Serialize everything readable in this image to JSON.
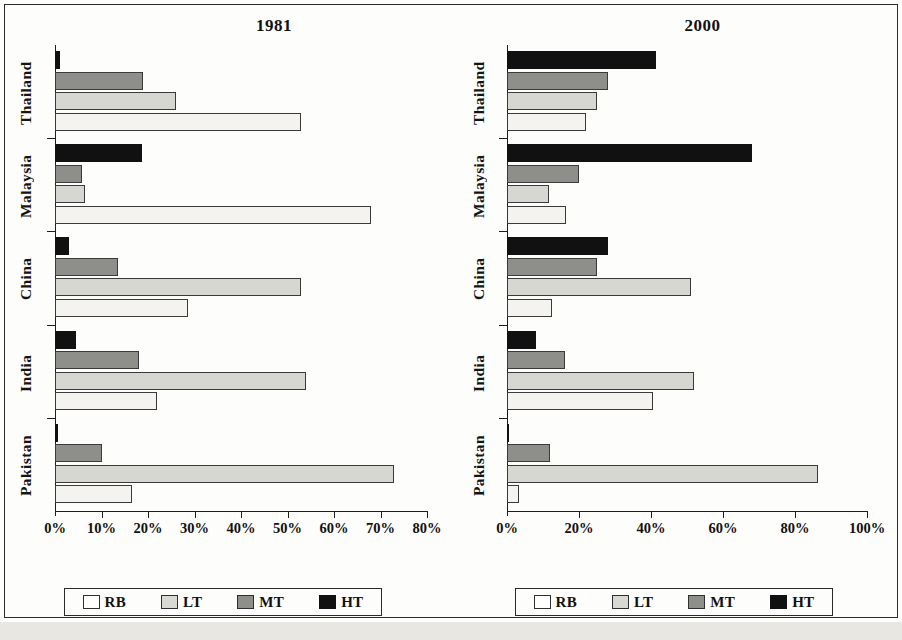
{
  "chart_data": [
    {
      "type": "bar",
      "title": "1981",
      "orientation": "horizontal",
      "grouped": true,
      "categories": [
        "Thailand",
        "Malaysia",
        "China",
        "India",
        "Pakistan"
      ],
      "series": [
        {
          "name": "RB",
          "color": "#f4f3ef",
          "values": [
            53.0,
            68.0,
            28.5,
            22.0,
            16.5
          ]
        },
        {
          "name": "LT",
          "color": "#d7d7d2",
          "values": [
            26.0,
            6.4,
            53.0,
            54.0,
            73.0
          ]
        },
        {
          "name": "MT",
          "color": "#8e8e8b",
          "values": [
            19.0,
            5.8,
            13.5,
            18.0,
            10.0
          ]
        },
        {
          "name": "HT",
          "color": "#111111",
          "values": [
            1.0,
            18.8,
            3.0,
            4.5,
            0.6
          ]
        }
      ],
      "xlabel": "",
      "ylabel": "",
      "xlim": [
        0,
        80
      ],
      "xticks": [
        0,
        10,
        20,
        30,
        40,
        50,
        60,
        70,
        80
      ],
      "xticklabels": [
        "0%",
        "10%",
        "20%",
        "30%",
        "40%",
        "50%",
        "60%",
        "70%",
        "80%"
      ],
      "grid": false,
      "legend_position": "bottom",
      "legend_entries": [
        "RB",
        "LT",
        "MT",
        "HT"
      ]
    },
    {
      "type": "bar",
      "title": "2000",
      "orientation": "horizontal",
      "grouped": true,
      "categories": [
        "Thailand",
        "Malaysia",
        "China",
        "India",
        "Pakistan"
      ],
      "series": [
        {
          "name": "RB",
          "color": "#f4f3ef",
          "values": [
            22.0,
            16.4,
            12.5,
            40.5,
            3.4
          ]
        },
        {
          "name": "LT",
          "color": "#d7d7d2",
          "values": [
            25.0,
            11.6,
            51.0,
            52.0,
            86.5
          ]
        },
        {
          "name": "MT",
          "color": "#8e8e8b",
          "values": [
            28.0,
            20.0,
            25.0,
            16.0,
            12.0
          ]
        },
        {
          "name": "HT",
          "color": "#111111",
          "values": [
            41.5,
            68.0,
            28.0,
            8.0,
            0.6
          ]
        }
      ],
      "xlabel": "",
      "ylabel": "",
      "xlim": [
        0,
        100
      ],
      "xticks": [
        0,
        20,
        40,
        60,
        80,
        100
      ],
      "xticklabels": [
        "0%",
        "20%",
        "40%",
        "60%",
        "80%",
        "100%"
      ],
      "grid": false,
      "legend_position": "bottom",
      "legend_entries": [
        "RB",
        "LT",
        "MT",
        "HT"
      ]
    }
  ],
  "legend": {
    "items": [
      {
        "key": "rb",
        "label": "RB"
      },
      {
        "key": "lt",
        "label": "LT"
      },
      {
        "key": "mt",
        "label": "MT"
      },
      {
        "key": "ht",
        "label": "HT"
      }
    ]
  },
  "colors": {
    "rb": "#f4f3ef",
    "lt": "#d7d7d2",
    "mt": "#8e8e8b",
    "ht": "#111111",
    "axis": "#1d1d1d",
    "text": "#111111"
  }
}
